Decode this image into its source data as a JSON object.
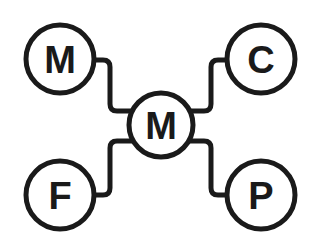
{
  "diagram": {
    "type": "hub-and-spoke",
    "stroke_color": "#1a1a1a",
    "background": "#ffffff",
    "center": {
      "label": "M",
      "cx": 161,
      "cy": 125,
      "r": 33
    },
    "nodes": [
      {
        "id": "top-left",
        "label": "M",
        "cx": 60,
        "cy": 59,
        "r": 35
      },
      {
        "id": "top-right",
        "label": "C",
        "cx": 261,
        "cy": 59,
        "r": 35
      },
      {
        "id": "bottom-left",
        "label": "F",
        "cx": 60,
        "cy": 195,
        "r": 35
      },
      {
        "id": "bottom-right",
        "label": "P",
        "cx": 261,
        "cy": 195,
        "r": 35
      }
    ]
  }
}
